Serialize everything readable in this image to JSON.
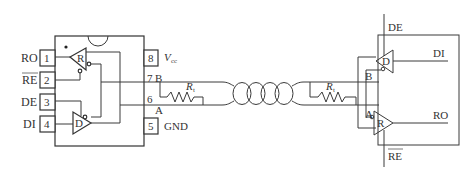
{
  "diagram": {
    "type": "RS-485 half-duplex transceiver link",
    "left_chip": {
      "pins_left": [
        {
          "number": "1",
          "label": "RO"
        },
        {
          "number": "2",
          "label": "RE",
          "overline": true
        },
        {
          "number": "3",
          "label": "DE"
        },
        {
          "number": "4",
          "label": "DI"
        }
      ],
      "pins_right": [
        {
          "number": "8",
          "label": "V",
          "subscript": "cc"
        },
        {
          "number": "7",
          "label": "B"
        },
        {
          "number": "6",
          "label": ""
        },
        {
          "number": "5",
          "label": "GND"
        }
      ],
      "receiver_label": "R",
      "driver_label": "D",
      "bus_label_a": "A"
    },
    "left_terminator": {
      "label": "R",
      "subscript": "t"
    },
    "right_terminator": {
      "label": "R",
      "subscript": "t"
    },
    "cable": {
      "type": "twisted pair"
    },
    "right_chip": {
      "top_signal": "DE",
      "bottom_signal": "RE",
      "bottom_signal_overline": true,
      "right_signals": [
        "DI",
        "RO"
      ],
      "bus_labels": [
        "B",
        "A"
      ],
      "driver_label": "D",
      "receiver_label": "R"
    }
  }
}
